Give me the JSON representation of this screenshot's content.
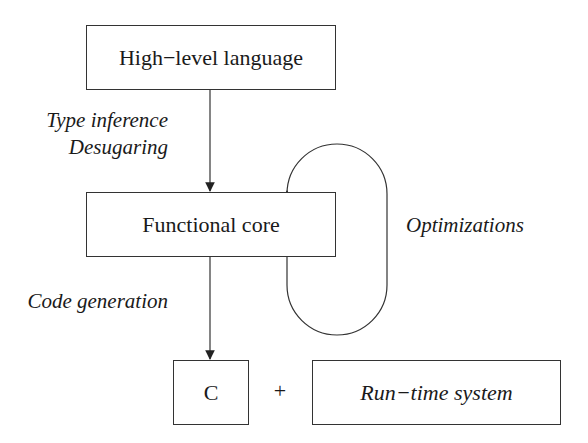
{
  "diagram": {
    "nodes": {
      "high_level": "High−level language",
      "functional_core": "Functional core",
      "c": "C",
      "runtime": "Run−time system"
    },
    "plus": "+",
    "edges": {
      "type_inference": "Type inference",
      "desugaring": "Desugaring",
      "optimizations": "Optimizations",
      "code_generation": "Code generation"
    },
    "colors": {
      "stroke": "#333333",
      "background": "#ffffff"
    }
  }
}
